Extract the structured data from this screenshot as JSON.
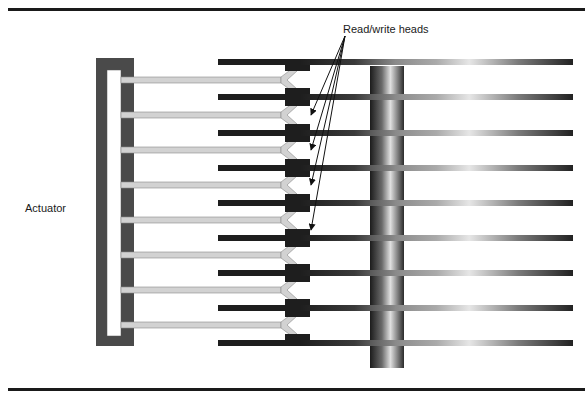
{
  "diagram": {
    "labels": {
      "heads": "Read/write heads",
      "actuator": "Actuator"
    },
    "colors": {
      "rule": "#1a1a1a",
      "actuator_frame": "#4a4a4a",
      "arm_fill": "#d2d2d2",
      "arm_edge": "#8a8a8a",
      "head_block": "#1e1e1e",
      "platter_dark": "#1e1e1e",
      "platter_light": "#e8e8e8",
      "spindle_dark": "#1c1c1c",
      "spindle_light": "#e0e0e0",
      "arrow": "#111111"
    },
    "platters_y": [
      62,
      97,
      133,
      168,
      203,
      238,
      273,
      308,
      343
    ],
    "arms_y": [
      80,
      115,
      150,
      185,
      220,
      255,
      290,
      325
    ],
    "arrow_targets_y": [
      115,
      150,
      185,
      230
    ],
    "counts": {
      "platters": 9,
      "arms": 8
    }
  }
}
